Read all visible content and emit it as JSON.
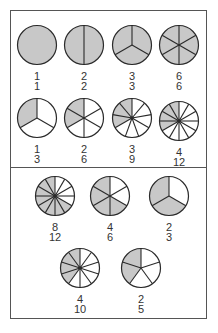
{
  "colors": {
    "shaded": "#c8c8c8",
    "unshaded": "#ffffff",
    "stroke": "#2a2a2a",
    "border": "#555555"
  },
  "panels": [
    {
      "name": "top-panel",
      "items": [
        {
          "numerator": "1",
          "denominator": "1",
          "shaded": 1,
          "parts": 1,
          "cx": 37,
          "cy": 45
        },
        {
          "numerator": "2",
          "denominator": "2",
          "shaded": 2,
          "parts": 2,
          "cx": 84,
          "cy": 45
        },
        {
          "numerator": "3",
          "denominator": "3",
          "shaded": 3,
          "parts": 3,
          "cx": 132,
          "cy": 45
        },
        {
          "numerator": "6",
          "denominator": "6",
          "shaded": 6,
          "parts": 6,
          "cx": 179,
          "cy": 45
        },
        {
          "numerator": "1",
          "denominator": "3",
          "shaded": 1,
          "parts": 3,
          "cx": 37,
          "cy": 118
        },
        {
          "numerator": "2",
          "denominator": "6",
          "shaded": 2,
          "parts": 6,
          "cx": 84,
          "cy": 118
        },
        {
          "numerator": "3",
          "denominator": "9",
          "shaded": 3,
          "parts": 9,
          "cx": 132,
          "cy": 118
        },
        {
          "numerator": "4",
          "denominator": "12",
          "shaded": 4,
          "parts": 12,
          "cx": 179,
          "cy": 121
        }
      ]
    },
    {
      "name": "bottom-panel",
      "items": [
        {
          "numerator": "8",
          "denominator": "12",
          "shaded": 8,
          "parts": 12,
          "cx": 55,
          "cy": 196
        },
        {
          "numerator": "4",
          "denominator": "6",
          "shaded": 4,
          "parts": 6,
          "cx": 110,
          "cy": 196
        },
        {
          "numerator": "2",
          "denominator": "3",
          "shaded": 2,
          "parts": 3,
          "cx": 169,
          "cy": 196
        },
        {
          "numerator": "4",
          "denominator": "10",
          "shaded": 4,
          "parts": 10,
          "cx": 80,
          "cy": 268
        },
        {
          "numerator": "2",
          "denominator": "5",
          "shaded": 2,
          "parts": 5,
          "cx": 141,
          "cy": 268
        }
      ]
    }
  ]
}
